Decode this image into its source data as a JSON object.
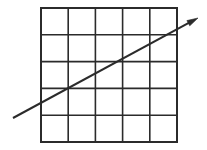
{
  "figure": {
    "background_color": "#ffffff",
    "width": 207,
    "height": 150
  },
  "chart_data": {
    "type": "scatter",
    "title": "",
    "xlabel": "",
    "ylabel": "",
    "grid": true,
    "legend": null,
    "grid_spec": {
      "rows": 5,
      "columns": 5,
      "cell_count": 25,
      "left": 41,
      "right": 177,
      "top": 8,
      "bottom": 142,
      "cell_width": 27.2,
      "cell_height": 26.8,
      "vertical_line_x": [
        41,
        68.2,
        95.4,
        122.6,
        149.8,
        177
      ],
      "horizontal_line_y": [
        8,
        34.8,
        61.6,
        88.4,
        115.2,
        142
      ],
      "stroke_color": "#2b2b2b",
      "outer_stroke_width": 2.0,
      "inner_stroke_width": 1.6,
      "fill": "#ffffff"
    },
    "arrow": {
      "x": [
        13,
        198
      ],
      "y": [
        118,
        18
      ],
      "start_point": [
        13,
        118
      ],
      "end_point": [
        198,
        18
      ],
      "slope": -0.541,
      "stroke_color": "#2b2b2b",
      "stroke_width": 2.0,
      "arrowhead": "filled-triangle",
      "arrowhead_at": "end",
      "arrowhead_length": 11,
      "arrowhead_width": 6,
      "enters_grid_at": [
        41,
        102.8
      ],
      "exits_grid_at": [
        177,
        29.3
      ]
    },
    "xlim": [
      0,
      207
    ],
    "ylim": [
      150,
      0
    ]
  }
}
